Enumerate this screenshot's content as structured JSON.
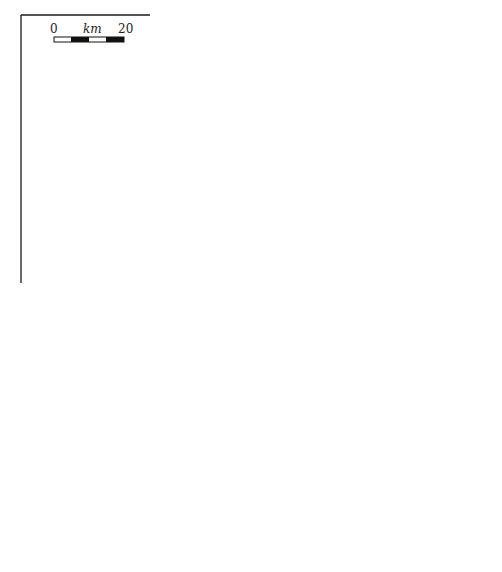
{
  "figure": {
    "caption": "(a)",
    "top_panel": {
      "scale_bar": {
        "start": "0",
        "unit": "km",
        "end": "20"
      },
      "title": "oceanic ridge",
      "layers": [
        "sediments",
        "basalt",
        "sheeted dikes",
        "gabbros"
      ],
      "isotherms": [
        "300",
        "600",
        "1100"
      ],
      "regions": {
        "left_bottom": "asthenosphere",
        "right_1": "depleted",
        "right_2": "lithosphere"
      }
    },
    "bottom_panel": {
      "title": "oceanic ridge",
      "layers": [
        "sediments",
        "basalt",
        "sheeted dikes",
        "gabbros"
      ],
      "facies": {
        "greenschist": "greenschist",
        "zeolite": "zeolite",
        "amph_1": "amphibolite",
        "amph_2": "to",
        "amph_3": "granulite"
      },
      "regions": {
        "left_bottom": "asthenosphere",
        "right_1": "depleted",
        "right_2": "lithosphere"
      }
    }
  },
  "colors": {
    "ink": "#1a1a1a",
    "arrow": "#444444",
    "basalt": "#9a9a9a",
    "sediment": "#2a2a2a"
  }
}
